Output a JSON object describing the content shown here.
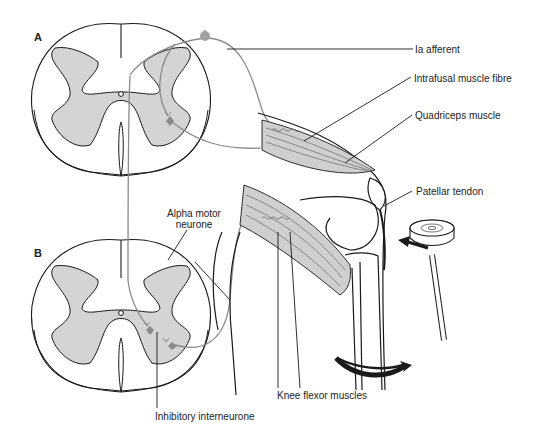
{
  "diagram": {
    "panels": [
      {
        "id": "A",
        "label": "A"
      },
      {
        "id": "B",
        "label": "B"
      }
    ],
    "labels": {
      "ia_afferent": "Ia afferent",
      "intrafusal_muscle_fibre": "Intrafusal muscle fibre",
      "quadriceps_muscle": "Quadriceps muscle",
      "patellar_tendon": "Patellar tendon",
      "alpha_motor_neurone_line1": "Alpha motor",
      "alpha_motor_neurone_line2": "neurone",
      "knee_flexor_muscles": "Knee flexor muscles",
      "inhibitory_interneurone": "Inhibitory interneurone"
    },
    "icons": {
      "reflex_hammer": "reflex-hammer",
      "tap_arrow": "left-arrow",
      "leg_kick_arrow": "curved-right-arrow"
    },
    "colors": {
      "grey_matter": "#d4d4d4",
      "muscle_fill": "#cfcfcf",
      "outline": "#1a1a1a",
      "nerve": "#8a8a8a",
      "background": "#ffffff"
    }
  }
}
